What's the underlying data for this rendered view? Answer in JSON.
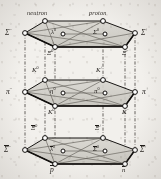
{
  "figure": {
    "colors": {
      "ink": "#1a1714",
      "paper": "#f2f0ec",
      "face_fill": "#cfcdc7",
      "node_fill": "#ffffff",
      "node_stroke": "#141210",
      "dash_line": "#3a3632"
    },
    "layers": [
      {
        "name": "top-layer",
        "id": "baryon-octet-top",
        "y": 33,
        "nodes": [
          {
            "id": "t-left",
            "label": "Σ",
            "sup": "−",
            "x": 20,
            "y": 38,
            "label_pos": "left"
          },
          {
            "id": "t-backleft",
            "label": "neutron",
            "sup": "",
            "x": 43,
            "y": 25,
            "label_pos": "above",
            "kind": "word"
          },
          {
            "id": "t-backright",
            "label": "proton",
            "sup": "",
            "x": 98,
            "y": 25,
            "label_pos": "above",
            "kind": "word"
          },
          {
            "id": "t-right",
            "label": "Σ",
            "sup": "+",
            "x": 140,
            "y": 38,
            "label_pos": "right"
          },
          {
            "id": "t-frontright",
            "label": "Ξ",
            "sup": "−",
            "x": 118,
            "y": 52,
            "label_pos": "below-right"
          },
          {
            "id": "t-frontleft",
            "label": "Ξ",
            "sup": "0",
            "x": 48,
            "y": 52,
            "label_pos": "below"
          },
          {
            "id": "t-center-left",
            "label": "λ",
            "sup": "0",
            "x": 58,
            "y": 38,
            "label_pos": "inner-left"
          },
          {
            "id": "t-center-right",
            "label": "Σ",
            "sup": "0",
            "x": 100,
            "y": 38,
            "label_pos": "inner-right"
          }
        ]
      },
      {
        "name": "middle-layer",
        "id": "meson-octet-middle",
        "y": 92,
        "nodes": [
          {
            "id": "m-left",
            "label": "π",
            "sup": "−",
            "x": 20,
            "y": 95,
            "label_pos": "left"
          },
          {
            "id": "m-backleft",
            "label": "K",
            "sup": "0",
            "x": 43,
            "y": 82,
            "label_pos": "above"
          },
          {
            "id": "m-backright",
            "label": "K",
            "sup": "+",
            "x": 98,
            "y": 82,
            "label_pos": "above"
          },
          {
            "id": "m-right",
            "label": "π",
            "sup": "+",
            "x": 140,
            "y": 95,
            "label_pos": "right"
          },
          {
            "id": "m-frontright",
            "label": "K",
            "sup": "−",
            "x": 118,
            "y": 110,
            "label_pos": "below-right"
          },
          {
            "id": "m-frontleft",
            "label": "K",
            "sup": "0",
            "x": 48,
            "y": 110,
            "label_pos": "below"
          },
          {
            "id": "m-center-left",
            "label": "η",
            "sup": "0",
            "x": 58,
            "y": 95,
            "label_pos": "inner-left"
          },
          {
            "id": "m-center-right",
            "label": "π",
            "sup": "0",
            "x": 100,
            "y": 95,
            "label_pos": "inner-right"
          }
        ]
      },
      {
        "name": "bottom-layer",
        "id": "antibaryon-octet-bottom",
        "y": 150,
        "nodes": [
          {
            "id": "b-left",
            "label": "Σ",
            "sup": "−",
            "x": 20,
            "y": 152,
            "label_pos": "left",
            "overbar": true
          },
          {
            "id": "b-backleft",
            "label": "Ξ",
            "sup": "0",
            "x": 43,
            "y": 139,
            "label_pos": "above",
            "overbar": true
          },
          {
            "id": "b-backright",
            "label": "Ξ",
            "sup": "+",
            "x": 98,
            "y": 139,
            "label_pos": "above",
            "overbar": true
          },
          {
            "id": "b-right",
            "label": "Σ",
            "sup": "+",
            "x": 140,
            "y": 152,
            "label_pos": "right",
            "overbar": true
          },
          {
            "id": "b-frontright",
            "label": "n",
            "sup": "",
            "x": 118,
            "y": 167,
            "label_pos": "below-right",
            "overbar": true
          },
          {
            "id": "b-frontleft",
            "label": "p",
            "sup": "",
            "x": 48,
            "y": 167,
            "label_pos": "below",
            "overbar": true
          },
          {
            "id": "b-center-left",
            "label": "λ",
            "sup": "0",
            "x": 58,
            "y": 152,
            "label_pos": "inner-left",
            "overbar": true
          },
          {
            "id": "b-center-right",
            "label": "Σ",
            "sup": "0",
            "x": 100,
            "y": 152,
            "label_pos": "inner-right",
            "overbar": true
          }
        ]
      }
    ],
    "labels": {
      "neutron": "neutron",
      "proton": "proton",
      "sigma_minus": "Σ",
      "sigma_plus": "Σ",
      "sigma_zero": "Σ",
      "lambda_zero": "λ",
      "xi_zero": "Ξ",
      "xi_minus": "Ξ",
      "pi_minus": "π",
      "pi_plus": "π",
      "pi_zero": "π",
      "eta_zero": "η",
      "kaon": "K",
      "p_bar": "p",
      "n_bar": "n",
      "sup_minus": "−",
      "sup_plus": "+",
      "sup_zero": "0"
    }
  }
}
